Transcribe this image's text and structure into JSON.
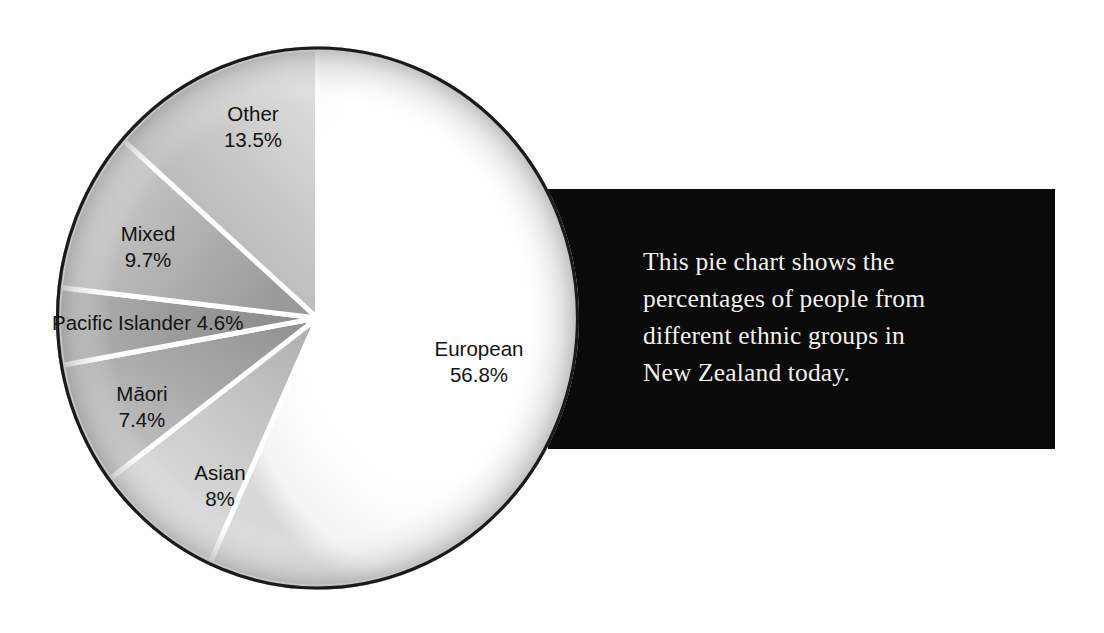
{
  "chart_data": {
    "type": "pie",
    "title": "",
    "subtitle": "",
    "xlabel": "",
    "ylabel": "",
    "legend_position": "on-slices",
    "grid": false,
    "units": "percent",
    "start_angle_deg": 0,
    "direction": "clockwise",
    "categories": [
      "European",
      "Asian",
      "Māori",
      "Pacific Islander",
      "Mixed",
      "Other"
    ],
    "values": [
      56.8,
      8,
      7.4,
      4.6,
      9.7,
      13.5
    ],
    "slices": [
      {
        "label": "European",
        "value": 56.8,
        "value_text": "56.8%",
        "label_text": "European\n56.8%",
        "fill": "#fdfdfd",
        "start_deg": 0.0,
        "end_deg": 204.5
      },
      {
        "label": "Asian",
        "value": 8.0,
        "value_text": "8%",
        "label_text": "Asian\n8%",
        "fill": "#c9c9c9",
        "start_deg": 204.5,
        "end_deg": 233.3
      },
      {
        "label": "Māori",
        "value": 7.4,
        "value_text": "7.4%",
        "label_text": "Māori\n7.4%",
        "fill": "#a8a8a8",
        "start_deg": 233.3,
        "end_deg": 259.9
      },
      {
        "label": "Pacific Islander",
        "value": 4.6,
        "value_text": "4.6%",
        "label_text": "Pacific Islander 4.6%",
        "fill": "#8f8f8f",
        "start_deg": 259.9,
        "end_deg": 276.5
      },
      {
        "label": "Mixed",
        "value": 9.7,
        "value_text": "9.7%",
        "label_text": "Mixed\n9.7%",
        "fill": "#b4b4b4",
        "start_deg": 276.5,
        "end_deg": 311.4
      },
      {
        "label": "Other",
        "value": 13.5,
        "value_text": "13.5%",
        "label_text": "Other\n13.5%",
        "fill": "#bdbdbd",
        "start_deg": 311.4,
        "end_deg": 360.0
      }
    ]
  },
  "caption": {
    "text": "This pie chart shows the\npercentages of people from\ndifferent ethnic groups in\nNew Zealand today.",
    "background_color": "#0a0a0a",
    "text_color": "#f2f0ec"
  },
  "colors": {
    "page_background": "#ffffff",
    "slice_outline": "#1a1a1a",
    "slice_divider": "#ffffff",
    "label_text": "#131313"
  }
}
